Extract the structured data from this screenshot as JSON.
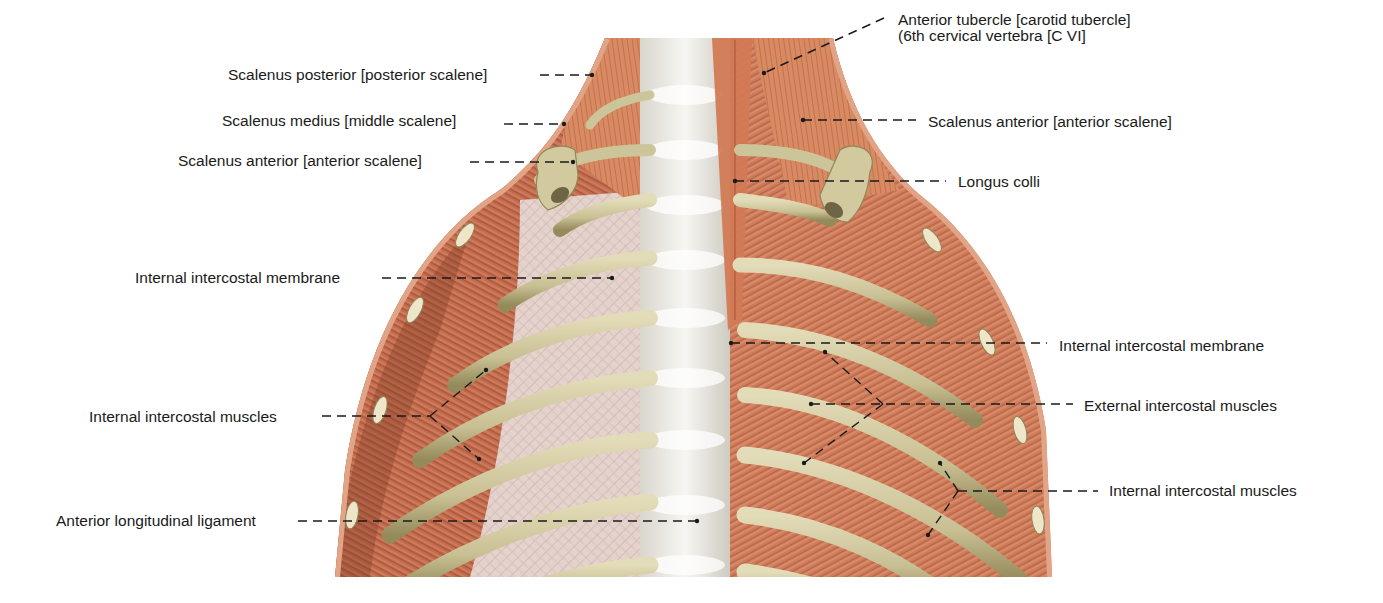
{
  "figure": {
    "colors": {
      "background": "#ffffff",
      "muscle": "#c8704f",
      "muscle_dark": "#8e3f2a",
      "muscle_light": "#dd9672",
      "rib": "#cfc7a0",
      "rib_shadow": "#8f8758",
      "membrane": "#e9e0dc",
      "spine": "#efeeea",
      "leader_line": "#1a1a1a",
      "text": "#1a1a1a"
    }
  },
  "labels_left": [
    {
      "id": "scalenus-posterior-left",
      "text": "Scalenus posterior [posterior scalene]",
      "x": 228,
      "y": 67,
      "leader": [
        [
          540,
          75
        ],
        [
          592,
          75
        ]
      ],
      "dots": [
        [
          592,
          75
        ]
      ]
    },
    {
      "id": "scalenus-medius-left",
      "text": "Scalenus medius [middle scalene]",
      "x": 222,
      "y": 113,
      "leader": [
        [
          504,
          124
        ],
        [
          564,
          124
        ]
      ],
      "dots": [
        [
          564,
          124
        ]
      ]
    },
    {
      "id": "scalenus-anterior-left",
      "text": "Scalenus anterior [anterior scalene]",
      "x": 178,
      "y": 153,
      "leader": [
        [
          470,
          162
        ],
        [
          573,
          162
        ]
      ],
      "dots": [
        [
          573,
          162
        ]
      ]
    },
    {
      "id": "internal-intercostal-membrane-left",
      "text": "Internal intercostal membrane",
      "x": 135,
      "y": 270,
      "leader": [
        [
          382,
          278
        ],
        [
          612,
          278
        ]
      ],
      "dots": [
        [
          612,
          278
        ]
      ]
    },
    {
      "id": "internal-intercostal-muscles-left",
      "text": "Internal intercostal muscles",
      "x": 89,
      "y": 409,
      "leader": [
        [
          322,
          416
        ],
        [
          430,
          416
        ]
      ],
      "branch": [
        [
          [
            430,
            416
          ],
          [
            486,
            370
          ]
        ],
        [
          [
            430,
            416
          ],
          [
            479,
            459
          ]
        ]
      ],
      "dots": [
        [
          486,
          370
        ],
        [
          479,
          459
        ]
      ]
    },
    {
      "id": "anterior-longitudinal-ligament",
      "text": "Anterior longitudinal ligament",
      "x": 56,
      "y": 513,
      "leader": [
        [
          298,
          521
        ],
        [
          697,
          521
        ]
      ],
      "dots": [
        [
          697,
          521
        ]
      ]
    }
  ],
  "labels_right": [
    {
      "id": "anterior-tubercle",
      "text": "Anterior tubercle [carotid tubercle]",
      "text2": "(6th cervical vertebra [C VI]",
      "x": 898,
      "y": 12,
      "leader": [
        [
          884,
          18
        ],
        [
          764,
          73
        ]
      ],
      "dots": [
        [
          764,
          73
        ]
      ]
    },
    {
      "id": "scalenus-anterior-right",
      "text": "Scalenus anterior [anterior scalene]",
      "x": 928,
      "y": 114,
      "leader": [
        [
          803,
          120
        ],
        [
          916,
          120
        ]
      ],
      "dots": [
        [
          803,
          120
        ]
      ]
    },
    {
      "id": "longus-colli",
      "text": "Longus colli",
      "x": 958,
      "y": 174,
      "leader": [
        [
          735,
          181
        ],
        [
          946,
          181
        ]
      ],
      "dots": [
        [
          735,
          181
        ]
      ]
    },
    {
      "id": "internal-intercostal-membrane-right",
      "text": "Internal intercostal membrane",
      "x": 1059,
      "y": 338,
      "leader": [
        [
          731,
          343
        ],
        [
          1047,
          343
        ]
      ],
      "dots": [
        [
          731,
          343
        ]
      ]
    },
    {
      "id": "external-intercostal-muscles",
      "text": "External intercostal muscles",
      "x": 1084,
      "y": 398,
      "leader": [
        [
          811,
          404
        ],
        [
          1073,
          404
        ]
      ],
      "branch": [
        [
          [
            883,
            404
          ],
          [
            825,
            352
          ]
        ],
        [
          [
            883,
            404
          ],
          [
            804,
            463
          ]
        ]
      ],
      "dots": [
        [
          811,
          404
        ],
        [
          825,
          352
        ],
        [
          804,
          463
        ]
      ]
    },
    {
      "id": "internal-intercostal-muscles-right",
      "text": "Internal intercostal muscles",
      "x": 1109,
      "y": 483,
      "leader": [
        [
          958,
          491
        ],
        [
          1098,
          491
        ]
      ],
      "branch": [
        [
          [
            958,
            491
          ],
          [
            940,
            463
          ]
        ],
        [
          [
            958,
            491
          ],
          [
            928,
            535
          ]
        ]
      ],
      "dots": [
        [
          940,
          463
        ],
        [
          928,
          535
        ]
      ]
    }
  ]
}
